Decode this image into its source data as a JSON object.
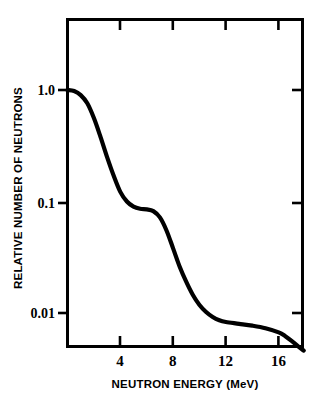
{
  "chart_data": {
    "type": "line",
    "title": "",
    "xlabel": "NEUTRON ENERGY (MeV)",
    "ylabel": "RELATIVE NUMBER OF NEUTRONS",
    "yscale": "log",
    "xscale": "linear",
    "xlim": [
      0,
      18
    ],
    "ylim": [
      0.005,
      1.15
    ],
    "grid": false,
    "legend": null,
    "xticks": [
      4,
      8,
      12,
      16
    ],
    "xtick_labels": [
      "4",
      "8",
      "12",
      "16"
    ],
    "yticks": [
      1.0,
      0.1,
      0.01
    ],
    "ytick_labels": [
      "1.0",
      "0.1",
      "0.01"
    ],
    "series": [
      {
        "name": "neutron spectrum",
        "x": [
          0.0,
          0.5,
          1.0,
          1.5,
          2.0,
          2.5,
          3.0,
          3.5,
          4.0,
          4.5,
          5.0,
          5.5,
          6.0,
          6.5,
          7.0,
          7.5,
          8.0,
          8.5,
          9.0,
          9.5,
          10.0,
          10.5,
          11.0,
          11.5,
          12.0,
          13.0,
          14.0,
          15.0,
          16.0,
          16.5,
          17.0,
          17.5,
          17.9
        ],
        "y": [
          1.0,
          0.98,
          0.9,
          0.76,
          0.56,
          0.38,
          0.25,
          0.17,
          0.122,
          0.1,
          0.09,
          0.086,
          0.085,
          0.082,
          0.072,
          0.055,
          0.038,
          0.026,
          0.019,
          0.0145,
          0.0118,
          0.0102,
          0.0092,
          0.0086,
          0.0083,
          0.008,
          0.0077,
          0.0073,
          0.0067,
          0.0062,
          0.0056,
          0.005,
          0.0046
        ]
      }
    ]
  },
  "axes": {
    "x_axis_title": "NEUTRON ENERGY (MeV)",
    "y_axis_title": "RELATIVE NUMBER OF NEUTRONS",
    "x_tick_labels": [
      "4",
      "8",
      "12",
      "16"
    ],
    "y_tick_labels": [
      "1.0",
      "0.1",
      "0.01"
    ]
  },
  "colors": {
    "background": "#ffffff",
    "ink": "#000000",
    "curve": "#000000",
    "frame": "#000000"
  }
}
